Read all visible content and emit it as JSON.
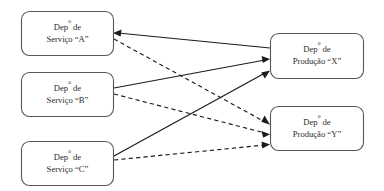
{
  "diagram": {
    "type": "flow-diagram",
    "title": "",
    "background_color": "#ffffff",
    "node_stroke_color": "#58585a",
    "edge_color": "#1c1c1c",
    "text_color": "#2b2b2b",
    "nodes": [
      {
        "id": "A",
        "line1": "Dep",
        "sup": "o",
        "line1_tail": " de",
        "line2": "Serviço “A”",
        "group": "servico"
      },
      {
        "id": "B",
        "line1": "Dep",
        "sup": "o",
        "line1_tail": " de",
        "line2": "Serviço “B”",
        "group": "servico"
      },
      {
        "id": "C",
        "line1": "Dep",
        "sup": "o",
        "line1_tail": " de",
        "line2": "Serviço “C”",
        "group": "servico"
      },
      {
        "id": "X",
        "line1": "Dep",
        "sup": "o",
        "line1_tail": " de",
        "line2": "Produção “X”",
        "group": "producao"
      },
      {
        "id": "Y",
        "line1": "Dep",
        "sup": "o",
        "line1_tail": " de",
        "line2": "Produção “Y”",
        "group": "producao"
      }
    ],
    "edges": [
      {
        "from": "X",
        "to": "A",
        "style": "solid"
      },
      {
        "from": "A",
        "to": "Y",
        "style": "dashed"
      },
      {
        "from": "B",
        "to": "X",
        "style": "solid"
      },
      {
        "from": "B",
        "to": "Y",
        "style": "dashed"
      },
      {
        "from": "C",
        "to": "X",
        "style": "solid"
      },
      {
        "from": "C",
        "to": "Y",
        "style": "dashed"
      }
    ]
  }
}
